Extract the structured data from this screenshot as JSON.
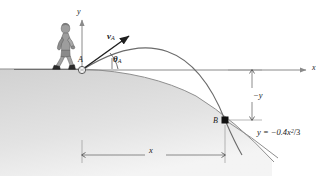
{
  "figure": {
    "kind": "projectile-motion-diagram",
    "width": 325,
    "height": 176,
    "background": "#ffffff"
  },
  "axes": {
    "y_label": "y",
    "x_label": "x",
    "origin_label": "A",
    "origin": {
      "x": 82,
      "y": 70
    },
    "x_axis_end": {
      "x": 310,
      "y": 70
    },
    "y_axis_top": {
      "x": 82,
      "y": 16
    }
  },
  "points": [
    {
      "name": "A",
      "label": "A",
      "x": 82,
      "y": 70,
      "marker": "circle"
    },
    {
      "name": "B",
      "label": "B",
      "x": 225,
      "y": 120,
      "marker": "square"
    }
  ],
  "vectors": [
    {
      "name": "initial-velocity",
      "label": "v",
      "subscript": "A",
      "from": {
        "x": 82,
        "y": 70
      },
      "to": {
        "x": 131,
        "y": 34
      },
      "angle_label": "θ",
      "angle_subscript": "A"
    }
  ],
  "curves": {
    "trajectory": {
      "name": "projectile-path",
      "stroke": "#6b6b6b",
      "apex": {
        "x": 181,
        "y": 37
      }
    },
    "hill": {
      "name": "hill-profile",
      "equation_label": "y = −0.4x",
      "equation_exponent": "2",
      "equation_denominator": "/3",
      "equation_full": "y = -0.4x²/3",
      "stroke": "#8a8a8a",
      "fill": "#d9d9d9"
    }
  },
  "dimensions": [
    {
      "name": "vertical-drop",
      "label": "−y",
      "orientation": "vertical",
      "at_x": 252,
      "from_y": 70,
      "to_y": 120
    },
    {
      "name": "horizontal-range",
      "label": "x",
      "orientation": "horizontal",
      "at_y": 155,
      "from_x": 82,
      "to_x": 225
    }
  ],
  "person": {
    "name": "walking-person",
    "fill": "#9a9a9a",
    "stroke": "#5a5a5a"
  },
  "colors": {
    "ink": "#1a1a1a",
    "axis": "#8a8a8a",
    "curve": "#6b6b6b",
    "hill_fill": "#d9d9d9",
    "dimension": "#9a9a9a"
  }
}
